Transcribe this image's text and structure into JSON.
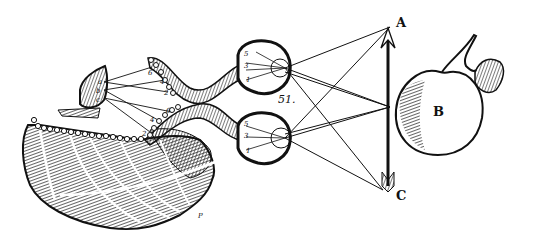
{
  "figure": {
    "figure_number": "51.",
    "labels": {
      "arrow_top": "A",
      "apple": "B",
      "arrow_bottom": "C",
      "brain_point": "P",
      "pineal_a": "a",
      "pineal_b": "b",
      "pineal_c": "c",
      "eye_top_1": "1",
      "eye_top_3": "3",
      "eye_top_5": "5",
      "eye_bottom_1": "1",
      "eye_bottom_3": "3",
      "eye_bottom_5": "5",
      "nerve_top_2": "2",
      "nerve_top_4": "4",
      "nerve_top_6": "6",
      "nerve_bottom_2": "2",
      "nerve_bottom_4": "4",
      "nerve_bottom_6": "6"
    },
    "colors": {
      "ink": "#111111",
      "paper": "#ffffff"
    }
  }
}
